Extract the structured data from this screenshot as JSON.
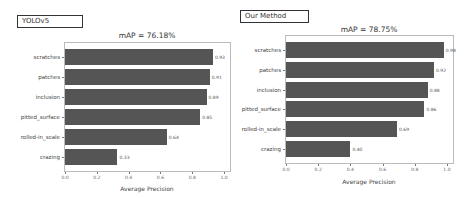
{
  "colors": {
    "bar": "#555555",
    "frame": "#bbbbbb",
    "text": "#333333"
  },
  "chart_data": [
    {
      "type": "bar",
      "orientation": "horizontal",
      "label_box": "YOLOv5",
      "title": "mAP = 76.18%",
      "categories": [
        "scratches",
        "patches",
        "inclusion",
        "pitted_surface",
        "rolled-in_scale",
        "crazing"
      ],
      "values": [
        0.93,
        0.91,
        0.89,
        0.85,
        0.64,
        0.33
      ],
      "value_labels": [
        "0.93",
        "0.91",
        "0.89",
        "0.85",
        "0.64",
        "0.33"
      ],
      "xlabel": "Average Precision",
      "ylabel": "",
      "xlim": [
        0,
        1.0
      ],
      "xticks": [
        "0.0",
        "0.2",
        "0.4",
        "0.6",
        "0.8",
        "1.0"
      ],
      "grid": false,
      "legend": "none"
    },
    {
      "type": "bar",
      "orientation": "horizontal",
      "label_box": "Our Method",
      "title": "mAP = 78.75%",
      "categories": [
        "scratches",
        "patches",
        "inclusion",
        "pitted_surface",
        "rolled-in_scale",
        "crazing"
      ],
      "values": [
        0.98,
        0.92,
        0.88,
        0.86,
        0.69,
        0.4
      ],
      "value_labels": [
        "0.98",
        "0.92",
        "0.88",
        "0.86",
        "0.69",
        "0.40"
      ],
      "xlabel": "Average Precision",
      "ylabel": "",
      "xlim": [
        0,
        1.0
      ],
      "xticks": [
        "0.0",
        "0.2",
        "0.4",
        "0.6",
        "0.8",
        "1.0"
      ],
      "grid": false,
      "legend": "none"
    }
  ]
}
